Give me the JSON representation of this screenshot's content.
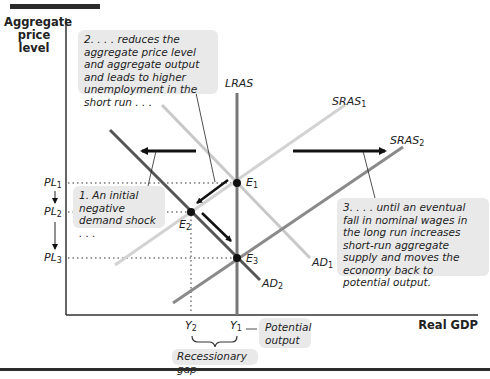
{
  "axes": {
    "y_label": "Aggregate price level",
    "x_label": "Real GDP"
  },
  "curves": {
    "lras": {
      "label": "LRAS",
      "sub": ""
    },
    "sras1": {
      "label": "SRAS",
      "sub": "1"
    },
    "sras2": {
      "label": "SRAS",
      "sub": "2"
    },
    "ad1": {
      "label": "AD",
      "sub": "1"
    },
    "ad2": {
      "label": "AD",
      "sub": "2"
    }
  },
  "points": {
    "e1": {
      "label": "E",
      "sub": "1"
    },
    "e2": {
      "label": "E",
      "sub": "2"
    },
    "e3": {
      "label": "E",
      "sub": "3"
    }
  },
  "price_levels": {
    "pl1": {
      "label": "PL",
      "sub": "1"
    },
    "pl2": {
      "label": "PL",
      "sub": "2"
    },
    "pl3": {
      "label": "PL",
      "sub": "3"
    }
  },
  "outputs": {
    "y2": {
      "label": "Y",
      "sub": "2"
    },
    "y1": {
      "label": "Y",
      "sub": "1"
    }
  },
  "annotations": {
    "step1": "1. An initial negative demand shock . . .",
    "step2": "2. . . . reduces the aggregate price level and aggregate output and leads to higher unemployment in the short run . . .",
    "step3": "3. . . . until an eventual fall in nominal wages in the long run increases short-run aggregate supply and moves the economy back to potential output.",
    "potential_output": "Potential output",
    "recessionary_gap": "Recessionary gap"
  },
  "colors": {
    "axis": "#333333",
    "lras": "#777777",
    "ad1": "#c8c8c8",
    "ad2": "#555555",
    "sras1": "#d2d2d2",
    "sras2": "#8a8a8a",
    "arrow": "#111111",
    "note_bg": "#e9e9e9"
  }
}
